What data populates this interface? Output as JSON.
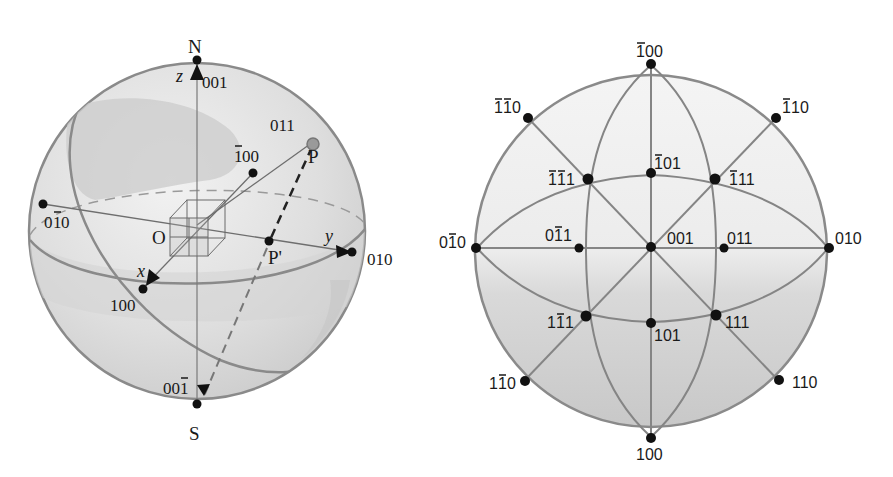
{
  "colors": {
    "background": "#ffffff",
    "sphere_fill_light": "#e9e9e9",
    "sphere_fill_dark": "#cfcfcf",
    "outline": "#8a8a8a",
    "line": "#7a7a7a",
    "point": "#111111",
    "pole_P": "#8c8c8c"
  },
  "left_sphere": {
    "title": "Reference sphere",
    "pole_north": "N",
    "pole_south": "S",
    "origin": "O",
    "axes": {
      "x": "x",
      "y": "y",
      "z": "z"
    },
    "point_P": "P",
    "point_P_projection": "P'",
    "poles": [
      {
        "id": "001",
        "label": "001"
      },
      {
        "id": "011",
        "label": "011"
      },
      {
        "id": "-100",
        "label_bar": "1",
        "label_rest": "00"
      },
      {
        "id": "0-10",
        "label_a": "0",
        "label_bar": "1",
        "label_rest": "0"
      },
      {
        "id": "010",
        "label": "010"
      },
      {
        "id": "100",
        "label": "100"
      },
      {
        "id": "00-1",
        "label_a": "00",
        "label_bar": "1"
      }
    ]
  },
  "right_projection": {
    "title": "Stereographic projection",
    "poles": [
      {
        "id": "-100",
        "display": "̅1 00",
        "label_parts": [
          "1",
          "00"
        ],
        "bars": [
          0
        ]
      },
      {
        "id": "-1-10",
        "label_parts": [
          "1",
          "1",
          "0"
        ],
        "bars": [
          0,
          1
        ]
      },
      {
        "id": "-110",
        "label_parts": [
          "1",
          "10"
        ],
        "bars": [
          0
        ]
      },
      {
        "id": "-101",
        "label_parts": [
          "1",
          "01"
        ],
        "bars": [
          0
        ]
      },
      {
        "id": "-1-11",
        "label_parts": [
          "1",
          "1",
          "1"
        ],
        "bars": [
          0,
          1
        ]
      },
      {
        "id": "-111",
        "label_parts": [
          "1",
          "11"
        ],
        "bars": [
          0
        ]
      },
      {
        "id": "0-10",
        "label_parts": [
          "0",
          "1",
          "0"
        ],
        "bars": [
          1
        ]
      },
      {
        "id": "0-11",
        "label_parts": [
          "0",
          "1",
          "1"
        ],
        "bars": [
          1
        ]
      },
      {
        "id": "001",
        "label": "001"
      },
      {
        "id": "011",
        "label": "011"
      },
      {
        "id": "010",
        "label": "010"
      },
      {
        "id": "1-11",
        "label_parts": [
          "1",
          "1",
          "1"
        ],
        "bars": [
          1
        ]
      },
      {
        "id": "101",
        "label": "101"
      },
      {
        "id": "111",
        "label": "111"
      },
      {
        "id": "1-10",
        "label_parts": [
          "1",
          "1",
          "0"
        ],
        "bars": [
          1
        ]
      },
      {
        "id": "110",
        "label": "110"
      },
      {
        "id": "100",
        "label": "100"
      }
    ]
  }
}
